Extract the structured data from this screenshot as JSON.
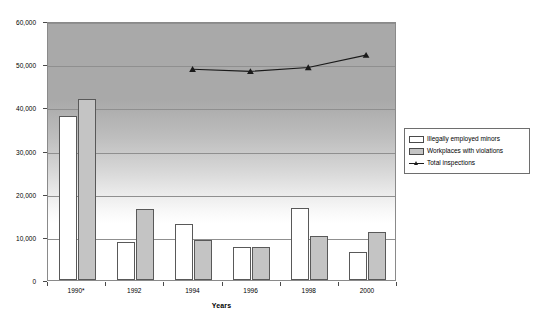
{
  "chart_data": {
    "type": "bar",
    "title": "",
    "subtitle": "",
    "xlabel": "Years",
    "ylabel": "",
    "categories": [
      "1990*",
      "1992",
      "1994",
      "1996",
      "1998",
      "2000"
    ],
    "ylim": [
      0,
      60000
    ],
    "ytick_values": [
      0,
      10000,
      20000,
      30000,
      40000,
      50000,
      60000
    ],
    "ytick_labels": [
      "0",
      "10,000",
      "20,000",
      "30,000",
      "40,000",
      "50,000",
      "60,000"
    ],
    "grid": true,
    "legend_position": "right",
    "series": [
      {
        "name": "Illegally employed minors",
        "kind": "bar",
        "color": "#ffffff",
        "values": [
          38000,
          8700,
          13000,
          7700,
          16700,
          6600
        ]
      },
      {
        "name": "Workplaces with violations",
        "kind": "bar",
        "color": "#c4c4c4",
        "values": [
          42000,
          16500,
          9300,
          7700,
          10200,
          11100
        ]
      },
      {
        "name": "Total inspections",
        "kind": "line",
        "color": "#1a1a1a",
        "marker": "triangle",
        "values": [
          null,
          null,
          49200,
          48700,
          49600,
          52500
        ]
      }
    ]
  },
  "axes": {
    "x_title": "Years",
    "x_tick_labels": [
      "1990*",
      "1992",
      "1994",
      "1996",
      "1998",
      "2000"
    ],
    "y_tick_labels": [
      "60,000",
      "50,000",
      "40,000",
      "30,000",
      "20,000",
      "10,000",
      "0"
    ]
  },
  "legend": {
    "items": [
      {
        "label": "Illegally employed minors",
        "swatch": "white-bar-swatch"
      },
      {
        "label": "Workplaces with violations",
        "swatch": "gray-bar-swatch"
      },
      {
        "label": "Total inspections",
        "swatch": "line-triangle-marker"
      }
    ]
  },
  "colors": {
    "bar_minors": "#ffffff",
    "bar_violations": "#c4c4c4",
    "line_total": "#1a1a1a",
    "gridline": "#8f8f8f",
    "plot_border": "#8a8a8a",
    "bar_border": "#595959"
  }
}
